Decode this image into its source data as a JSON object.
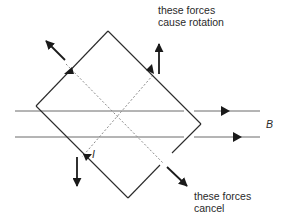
{
  "diagram": {
    "colors": {
      "line": "#2a2a2a",
      "field": "#6a6a6a",
      "dashed": "#8a8a8a",
      "background": "#ffffff"
    },
    "labels": {
      "rotation_line1": "these forces",
      "rotation_line2": "cause rotation",
      "cancel_line1": "these forces",
      "cancel_line2": "cancel",
      "field": "B",
      "current": "I"
    },
    "coil": {
      "corners": {
        "top": [
          108,
          31
        ],
        "right": [
          201,
          124
        ],
        "bottom": [
          128,
          198
        ],
        "left": [
          36,
          106
        ]
      }
    },
    "field_lines": [
      {
        "y": 111,
        "x_start": 15,
        "x_end": 260,
        "arrow_x": 225
      },
      {
        "y": 137,
        "x_start": 15,
        "x_end": 260,
        "arrow_x": 237
      }
    ],
    "forces": [
      {
        "name": "force-up-left",
        "from": [
          65,
          60
        ],
        "to": [
          45,
          40
        ]
      },
      {
        "name": "force-up",
        "from": [
          159,
          73
        ],
        "to": [
          159,
          43
        ]
      },
      {
        "name": "force-down",
        "from": [
          77,
          157
        ],
        "to": [
          77,
          187
        ]
      },
      {
        "name": "force-down-right",
        "from": [
          167,
          167
        ],
        "to": [
          188,
          187
        ]
      }
    ]
  }
}
